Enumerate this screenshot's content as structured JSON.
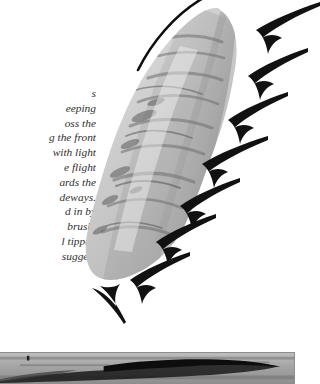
{
  "page": {
    "background_color": "#ffffff",
    "ink_color": "#111111"
  },
  "body_text": {
    "name": "body-paragraph-fragment",
    "lines": [
      "d the",
      "fore",
      "nd used",
      "ings and"
    ]
  },
  "caption_text": {
    "name": "figure-caption-italic",
    "lines": [
      "s",
      "eeping",
      "oss the",
      "g the front",
      "with light",
      "e flight",
      "ards the",
      "deways.",
      "d in by",
      "brush,",
      "l tipped",
      "suggest"
    ]
  },
  "wing_figure": {
    "name": "wing-brush-illustration",
    "description": "grayscale brush and wash painting of a bird wing angled from upper right to lower left",
    "stroke_color": "#101010",
    "wash_colors": [
      "#f2f2f2",
      "#d8d8d8",
      "#bdbdbd",
      "#9e9e9e",
      "#7c7c7c",
      "#5a5a5a"
    ],
    "leading_edge_line": "thin black ink arc over the top of the wing",
    "arrows": [
      {
        "label": "arrow-1",
        "points_to": "upper trailing edge"
      },
      {
        "label": "arrow-2",
        "points_to": "trailing edge"
      },
      {
        "label": "arrow-3",
        "points_to": "trailing edge"
      },
      {
        "label": "arrow-4",
        "points_to": "mid trailing edge"
      },
      {
        "label": "arrow-5",
        "points_to": "lower trailing edge"
      },
      {
        "label": "arrow-6",
        "points_to": "lower trailing edge"
      },
      {
        "label": "arrow-7",
        "points_to": "wing tip"
      },
      {
        "label": "arrow-8",
        "points_to": "below wing tip"
      }
    ],
    "arrow_count": 8,
    "arrow_color": "#111111"
  },
  "bottom_figure": {
    "name": "second-figure-panel",
    "description": "grayscale wash band with a dark horizontal ink mass",
    "border_color": "#8d8d8d",
    "background_color": "#a8a8a8",
    "ink_color": "#111111"
  }
}
